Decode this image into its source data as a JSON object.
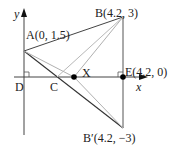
{
  "diagram": {
    "axes": {
      "x_label": "x",
      "y_label": "y"
    },
    "points": {
      "A": {
        "label": "A(0, 1.5)",
        "coords": [
          0,
          1.5
        ]
      },
      "B": {
        "label": "B(4.2, 3)",
        "coords": [
          4.2,
          3
        ]
      },
      "B_prime": {
        "label": "B′(4.2, −3)",
        "coords": [
          4.2,
          -3
        ]
      },
      "E": {
        "label": "E(4.2, 0)",
        "coords": [
          4.2,
          0
        ]
      },
      "C": {
        "label": "C"
      },
      "D": {
        "label": "D"
      },
      "X": {
        "label": "X"
      }
    },
    "colors": {
      "line": "#333333",
      "light_line": "#b0b0b0",
      "point": "#000000"
    }
  }
}
